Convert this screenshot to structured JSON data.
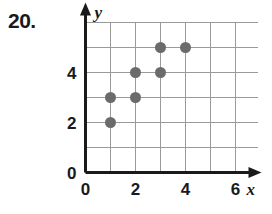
{
  "problem": {
    "number": "20."
  },
  "chart_data": {
    "type": "scatter",
    "title": "",
    "subtitle": "",
    "xlabel": "x",
    "ylabel": "y",
    "xlim": [
      0,
      6
    ],
    "ylim": [
      0,
      6
    ],
    "xticks": [
      0,
      2,
      4,
      6
    ],
    "xtick_labels": [
      "0",
      "2",
      "4",
      "6"
    ],
    "yticks": [
      0,
      2,
      4
    ],
    "ytick_labels": [
      "0",
      "2",
      "4"
    ],
    "grid": true,
    "grid_step": 1,
    "legend": false,
    "legend_position": "none",
    "point_color": "#6b6b6b",
    "point_radius": 5.5,
    "axis_color": "#1a1a1a",
    "grid_color": "#9a9a9a",
    "points": [
      {
        "x": 1,
        "y": 2
      },
      {
        "x": 1,
        "y": 3
      },
      {
        "x": 2,
        "y": 3
      },
      {
        "x": 2,
        "y": 4
      },
      {
        "x": 3,
        "y": 4
      },
      {
        "x": 3,
        "y": 5
      },
      {
        "x": 4,
        "y": 5
      }
    ]
  }
}
